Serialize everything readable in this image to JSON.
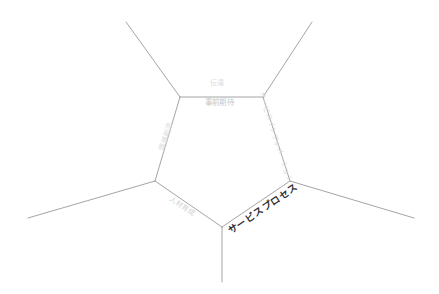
{
  "diagram": {
    "type": "voronoi-pentagon-boundary-diagram",
    "background_color": "#ffffff",
    "line_color": "#9a9a9a",
    "center_polygon": {
      "name": "pentagon",
      "sides": 5,
      "vertices": [
        {
          "id": "top-left",
          "x": 180,
          "y": 97
        },
        {
          "id": "top-right",
          "x": 263,
          "y": 97
        },
        {
          "id": "right",
          "x": 290,
          "y": 181
        },
        {
          "id": "bottom",
          "x": 222,
          "y": 227
        },
        {
          "id": "left",
          "x": 155,
          "y": 181
        }
      ]
    },
    "rays": [
      {
        "id": "ray-upper-left",
        "from": "top-left",
        "to_x": 126,
        "to_y": 22
      },
      {
        "id": "ray-upper-right",
        "from": "top-right",
        "to_x": 312,
        "to_y": 22
      },
      {
        "id": "ray-right",
        "from": "right",
        "to_x": 414,
        "to_y": 218
      },
      {
        "id": "ray-bottom",
        "from": "bottom",
        "to_x": 222,
        "to_y": 282
      },
      {
        "id": "ray-left",
        "from": "left",
        "to_x": 28,
        "to_y": 218
      }
    ],
    "labels": {
      "top_outer": {
        "text": "伝達",
        "edge": "top-edge",
        "position": "above",
        "color": "#dcdcdc",
        "rotation_deg": 0
      },
      "top_inner": {
        "text": "事前期待",
        "edge": "top-edge",
        "position": "below",
        "color": "#c9c9c9",
        "rotation_deg": 0
      },
      "upper_right": {
        "text": "サービスインフォメーション",
        "edge": "upper-right-edge",
        "color": "#d8d8d8",
        "rotation_deg": 72
      },
      "lower_right": {
        "text": "サービスプロセス",
        "edge": "lower-right-edge",
        "color": "#2e2e2e",
        "rotation_deg": -34
      },
      "lower_left": {
        "text": "人材育成",
        "edge": "lower-left-edge",
        "color": "#d2d2d2",
        "rotation_deg": 34
      },
      "upper_left": {
        "text": "価値創造",
        "edge": "upper-left-edge",
        "color": "#dcdcdc",
        "rotation_deg": -72
      }
    }
  }
}
